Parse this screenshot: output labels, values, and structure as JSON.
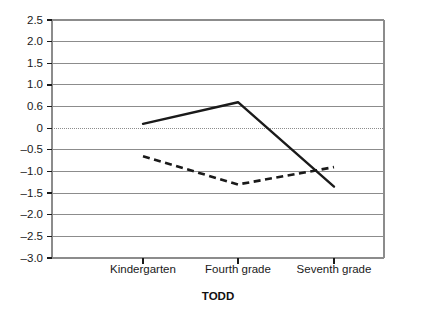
{
  "chart_data": {
    "type": "line",
    "title": "",
    "xlabel": "TODD",
    "ylabel": "",
    "categories": [
      "Kindergarten",
      "Fourth grade",
      "Seventh grade"
    ],
    "ylim": [
      -3.0,
      2.5
    ],
    "ytick_labels": [
      "2.5",
      "2.0",
      "1.5",
      "1.0",
      "0.6",
      "0",
      "–0.5",
      "–1.0",
      "–1.5",
      "–2.0",
      "–2.5",
      "–3.0"
    ],
    "ytick_values": [
      2.5,
      2.0,
      1.5,
      1.0,
      0.5,
      0.0,
      -0.5,
      -1.0,
      -1.5,
      -2.0,
      -2.5,
      -3.0
    ],
    "grid": true,
    "zero_line_style": "dotted",
    "legend": "none",
    "series": [
      {
        "name": "solid-series",
        "style": "solid",
        "color": "#1a1a1a",
        "values": [
          0.1,
          0.6,
          -1.35
        ]
      },
      {
        "name": "dashed-series",
        "style": "dashed",
        "color": "#1a1a1a",
        "values": [
          -0.65,
          -1.3,
          -0.9
        ]
      }
    ]
  },
  "plot": {
    "left": 52,
    "right": 384,
    "top": 20,
    "bottom": 258,
    "tick_x": [
      143,
      238,
      334
    ],
    "border_color": "#8c8c8c",
    "grid_color": "#8c8c8c",
    "background": "#ffffff"
  },
  "axis_title_pos": {
    "x": 218,
    "y": 300
  },
  "xlabel_y": 273
}
